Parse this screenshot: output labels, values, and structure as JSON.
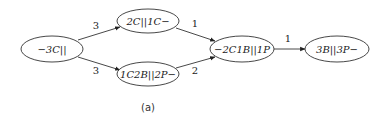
{
  "diagram": {
    "type": "directed-graph",
    "caption": "(a)",
    "nodes": [
      {
        "id": "A",
        "label": "−3C||",
        "cx": 52,
        "cy": 49
      },
      {
        "id": "B",
        "label": "2C||1C−",
        "cx": 148,
        "cy": 21
      },
      {
        "id": "C",
        "label": "1C2B||2P−",
        "cx": 148,
        "cy": 74
      },
      {
        "id": "D",
        "label": "−2C1B||1P",
        "cx": 242,
        "cy": 49
      },
      {
        "id": "E",
        "label": "3B||3P−",
        "cx": 337,
        "cy": 49
      }
    ],
    "edges": [
      {
        "from": "A",
        "to": "B",
        "label": "3"
      },
      {
        "from": "A",
        "to": "C",
        "label": "3"
      },
      {
        "from": "B",
        "to": "D",
        "label": "1"
      },
      {
        "from": "C",
        "to": "D",
        "label": "2"
      },
      {
        "from": "D",
        "to": "E",
        "label": "1"
      }
    ]
  }
}
